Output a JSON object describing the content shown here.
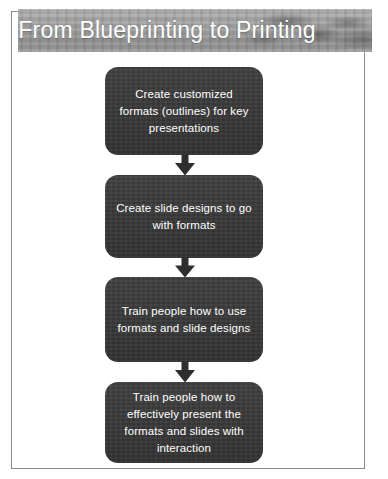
{
  "slide": {
    "title": "From Blueprinting to Printing",
    "background_color": "#ffffff",
    "frame_color": "#8d8d8d",
    "banner_color": "#9a9a9a",
    "node_color": "#3a3a3a",
    "node_text_color": "#ffffff",
    "arrow_color": "#2e2e2e"
  },
  "flow": {
    "nodes": [
      {
        "id": "node-1",
        "text": "Create customized formats (outlines) for key presentations"
      },
      {
        "id": "node-2",
        "text": "Create slide designs to go with formats"
      },
      {
        "id": "node-3",
        "text": "Train people how to use formats and slide designs"
      },
      {
        "id": "node-4",
        "text": "Train people how to effectively present the formats and slides with interaction"
      }
    ],
    "connectors": [
      {
        "id": "arrow-1",
        "from": "node-1",
        "to": "node-2",
        "shape": "down-arrow"
      },
      {
        "id": "arrow-2",
        "from": "node-2",
        "to": "node-3",
        "shape": "down-arrow"
      },
      {
        "id": "arrow-3",
        "from": "node-3",
        "to": "node-4",
        "shape": "down-arrow"
      }
    ]
  }
}
